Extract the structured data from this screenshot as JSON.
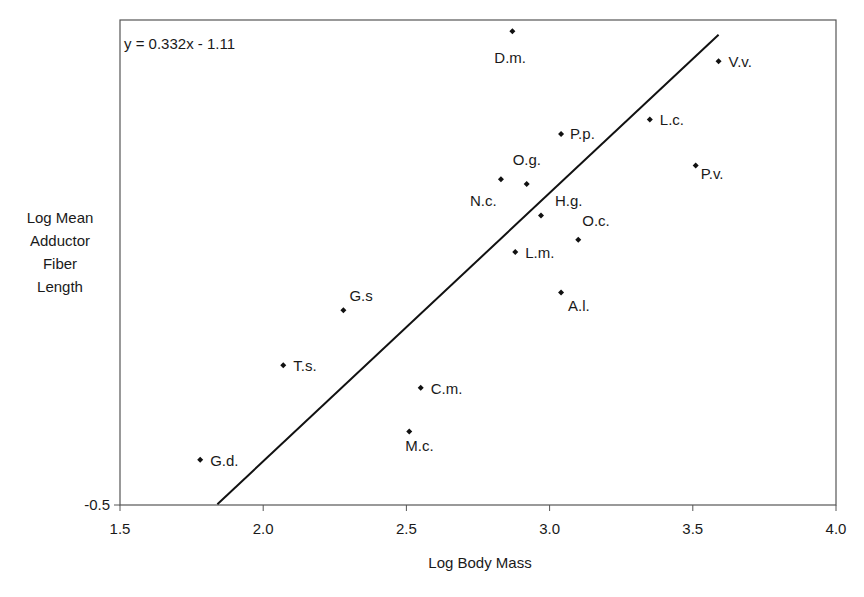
{
  "chart_data": {
    "type": "scatter",
    "title": "",
    "xlabel": "Log Body Mass",
    "ylabel_lines": [
      "Log Mean",
      "Adductor",
      "Fiber",
      "Length"
    ],
    "ylabel": "Log Mean Adductor Fiber Length",
    "xlim": [
      1.5,
      4.0
    ],
    "ylim": [
      -0.5,
      0.1
    ],
    "x_ticks": [
      1.5,
      2.0,
      2.5,
      3.0,
      3.5,
      4.0
    ],
    "x_tick_labels": [
      "1.5",
      "2.0",
      "2.5",
      "3.0",
      "3.5",
      "4.0"
    ],
    "y_ticks": [
      -0.5
    ],
    "y_tick_labels": [
      "-0.5"
    ],
    "grid": false,
    "legend": null,
    "trendline": {
      "equation": "y = 0.332x - 1.11",
      "slope": 0.332,
      "intercept": -1.11,
      "x_start": 1.84,
      "x_end": 3.59
    },
    "series": [
      {
        "name": "Species",
        "marker": "diamond",
        "points": [
          {
            "label": "D.m.",
            "x": 2.87,
            "y": 0.086,
            "label_dx": -18,
            "label_dy": 32
          },
          {
            "label": "V.v.",
            "x": 3.59,
            "y": 0.049,
            "label_dx": 10,
            "label_dy": 6
          },
          {
            "label": "L.c.",
            "x": 3.35,
            "y": -0.023,
            "label_dx": 10,
            "label_dy": 6
          },
          {
            "label": "P.p.",
            "x": 3.04,
            "y": -0.041,
            "label_dx": 9,
            "label_dy": 5
          },
          {
            "label": "P.v.",
            "x": 3.51,
            "y": -0.08,
            "label_dx": 5,
            "label_dy": 13
          },
          {
            "label": "N.c.",
            "x": 2.83,
            "y": -0.097,
            "label_dx": -31,
            "label_dy": 27
          },
          {
            "label": "O.g.",
            "x": 2.92,
            "y": -0.103,
            "label_dx": -14,
            "label_dy": -19
          },
          {
            "label": "H.g.",
            "x": 2.97,
            "y": -0.142,
            "label_dx": 14,
            "label_dy": -10
          },
          {
            "label": "O.c.",
            "x": 3.1,
            "y": -0.172,
            "label_dx": 4,
            "label_dy": -14
          },
          {
            "label": "L.m.",
            "x": 2.88,
            "y": -0.187,
            "label_dx": 10,
            "label_dy": 6
          },
          {
            "label": "A.l.",
            "x": 3.04,
            "y": -0.237,
            "label_dx": 7,
            "label_dy": 19
          },
          {
            "label": "G.s",
            "x": 2.28,
            "y": -0.259,
            "label_dx": 6,
            "label_dy": -9
          },
          {
            "label": "T.s.",
            "x": 2.07,
            "y": -0.327,
            "label_dx": 10,
            "label_dy": 6
          },
          {
            "label": "C.m.",
            "x": 2.55,
            "y": -0.355,
            "label_dx": 10,
            "label_dy": 6
          },
          {
            "label": "M.c.",
            "x": 2.51,
            "y": -0.409,
            "label_dx": -4,
            "label_dy": 20
          },
          {
            "label": "G.d.",
            "x": 1.78,
            "y": -0.444,
            "label_dx": 10,
            "label_dy": 6
          }
        ]
      }
    ]
  },
  "style": {
    "axis_color": "#555555",
    "line_color": "#111111",
    "marker_color": "#111111",
    "text_color": "#1a1a1a"
  }
}
